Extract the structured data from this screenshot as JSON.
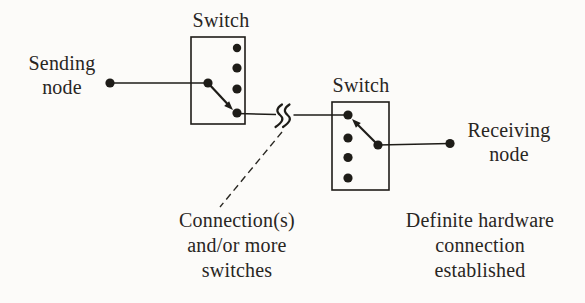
{
  "colors": {
    "background": "#fcfbf9",
    "ink": "#1e1c18",
    "text": "#29261f"
  },
  "diagram": {
    "sending_node": {
      "label": "Sending\nnode"
    },
    "receiving_node": {
      "label": "Receiving\nnode"
    },
    "switch1": {
      "label": "Switch",
      "port_count": 4
    },
    "switch2": {
      "label": "Switch",
      "port_count": 4
    },
    "icons": {
      "break": "line-break-squiggle-icon",
      "selector1": "switch-arm-arrow-down-right",
      "selector2": "switch-arm-arrow-up-left"
    },
    "captions": {
      "connections": "Connection(s)\nand/or more\nswitches",
      "established": "Definite hardware\nconnection\nestablished"
    }
  }
}
